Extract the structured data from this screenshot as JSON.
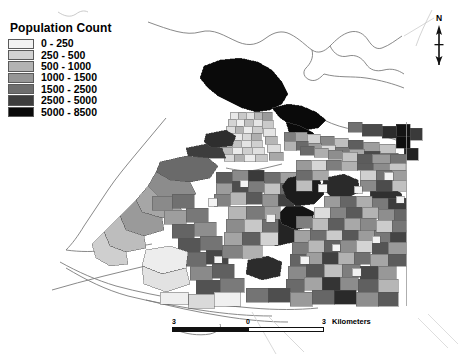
{
  "map": {
    "subject": "Vancouver census tract population choropleth",
    "background_color": "#ffffff",
    "outline_color": "#6e6e6e",
    "tract_border_color": "#555555"
  },
  "legend": {
    "title": "Population Count",
    "classes": [
      {
        "label": "0 - 250",
        "color": "#f2f2f2",
        "min": 0,
        "max": 250
      },
      {
        "label": "250 - 500",
        "color": "#d2d2d2",
        "min": 250,
        "max": 500
      },
      {
        "label": "500 - 1000",
        "color": "#b3b3b3",
        "min": 500,
        "max": 1000
      },
      {
        "label": "1000 - 1500",
        "color": "#969696",
        "min": 1000,
        "max": 1500
      },
      {
        "label": "1500 - 2500",
        "color": "#6e6e6e",
        "min": 1500,
        "max": 2500
      },
      {
        "label": "2500 - 5000",
        "color": "#3d3d3d",
        "min": 2500,
        "max": 5000
      },
      {
        "label": "5000 - 8500",
        "color": "#0a0a0a",
        "min": 5000,
        "max": 8500
      }
    ]
  },
  "north_arrow": {
    "label": "N"
  },
  "scale_bar": {
    "ticks": [
      "3",
      "0",
      "3"
    ],
    "units": "Kilometers"
  },
  "chart_data": {
    "type": "map",
    "title": "Population Count",
    "legend_position": "top-left",
    "classification": "graduated gray, 7 classes",
    "value_field": "Population Count",
    "units": "persons per census tract",
    "class_breaks": [
      0,
      250,
      500,
      1000,
      1500,
      2500,
      5000,
      8500
    ],
    "class_colors": [
      "#f2f2f2",
      "#d2d2d2",
      "#b3b3b3",
      "#969696",
      "#6e6e6e",
      "#3d3d3d",
      "#0a0a0a"
    ],
    "scale_bar_ticks": [
      "3",
      "0",
      "3"
    ],
    "scale_bar_units": "Kilometers",
    "north_arrow_label": "N"
  }
}
